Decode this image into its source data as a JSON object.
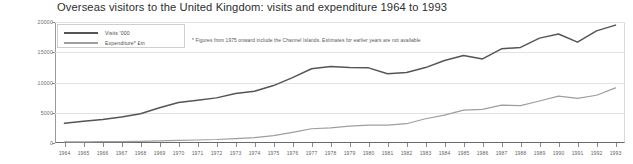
{
  "chart_data": {
    "type": "line",
    "title": "Overseas visitors to the United Kingdom: visits and expenditure 1964 to 1993",
    "xlabel": "",
    "ylabel": "",
    "ylim": [
      0,
      20000
    ],
    "yticks": [
      0,
      5000,
      10000,
      15000,
      20000
    ],
    "ytick_labels": [
      "0",
      "5000",
      "10000",
      "15000",
      "20000"
    ],
    "grid": true,
    "legend_position": "top-left",
    "annotation": "* Figures from 1975 onward include the Channel Islands. Estimates for earlier years are not available",
    "categories": [
      "1964",
      "1965",
      "1966",
      "1967",
      "1968",
      "1969",
      "1970",
      "1971",
      "1972",
      "1973",
      "1974",
      "1975",
      "1976",
      "1977",
      "1978",
      "1979",
      "1980",
      "1981",
      "1982",
      "1983",
      "1984",
      "1985",
      "1986",
      "1987",
      "1988",
      "1989",
      "1990",
      "1991",
      "1992",
      "1993"
    ],
    "series": [
      {
        "name": "Visits '000",
        "color": "#555555",
        "values": [
          3256,
          3591,
          3892,
          4290,
          4828,
          5821,
          6692,
          7065,
          7459,
          8167,
          8543,
          9490,
          10808,
          12281,
          12646,
          12486,
          12420,
          11452,
          11636,
          12464,
          13644,
          14449,
          13897,
          15566,
          15799,
          17338,
          18013,
          16665,
          18535,
          19488
        ]
      },
      {
        "name": "Expenditure* £m",
        "color": "#9e9e9e",
        "values": [
          190,
          193,
          219,
          236,
          282,
          359,
          433,
          499,
          576,
          728,
          898,
          1218,
          1768,
          2352,
          2507,
          2797,
          2961,
          2970,
          3188,
          4003,
          4614,
          5442,
          5553,
          6260,
          6184,
          6945,
          7748,
          7386,
          7891,
          9113
        ]
      }
    ]
  }
}
